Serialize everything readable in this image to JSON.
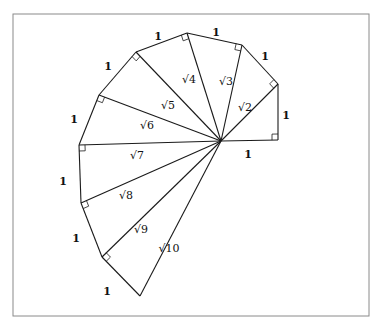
{
  "diagram": {
    "center": [
      221,
      141
    ],
    "vertices": [
      [
        278,
        140
      ],
      [
        278,
        84
      ],
      [
        242,
        45
      ],
      [
        187,
        33
      ],
      [
        136,
        52
      ],
      [
        99,
        95
      ],
      [
        79,
        145
      ],
      [
        81,
        203
      ],
      [
        102,
        257
      ],
      [
        140,
        296
      ]
    ],
    "outer_edge_label": "1",
    "outer_labels": [
      {
        "text": "1",
        "x": 248,
        "y": 155
      },
      {
        "text": "1",
        "x": 286,
        "y": 116
      },
      {
        "text": "1",
        "x": 265,
        "y": 57
      },
      {
        "text": "1",
        "x": 216,
        "y": 33
      },
      {
        "text": "1",
        "x": 158,
        "y": 37
      },
      {
        "text": "1",
        "x": 108,
        "y": 67
      },
      {
        "text": "1",
        "x": 74,
        "y": 120
      },
      {
        "text": "1",
        "x": 63,
        "y": 182
      },
      {
        "text": "1",
        "x": 76,
        "y": 239
      },
      {
        "text": "1",
        "x": 107,
        "y": 292
      }
    ],
    "spoke_labels": [
      {
        "text": "√2",
        "x": 245,
        "y": 108
      },
      {
        "text": "√3",
        "x": 226,
        "y": 82
      },
      {
        "text": "√4",
        "x": 189,
        "y": 80
      },
      {
        "text": "√5",
        "x": 168,
        "y": 106
      },
      {
        "text": "√6",
        "x": 147,
        "y": 126
      },
      {
        "text": "√7",
        "x": 137,
        "y": 156
      },
      {
        "text": "√8",
        "x": 126,
        "y": 196
      },
      {
        "text": "√9",
        "x": 141,
        "y": 230
      },
      {
        "text": "√10",
        "x": 169,
        "y": 249
      }
    ]
  }
}
